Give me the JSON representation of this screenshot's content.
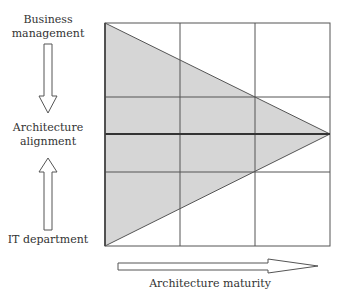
{
  "labels": {
    "top": "Business\nmanagement",
    "middle": "Architecture\nalignment",
    "bottom": "IT department",
    "x_axis": "Architecture maturity"
  },
  "grid": {
    "columns": 3,
    "rows": 4,
    "emphasized_row_line": 2
  },
  "colors": {
    "triangle_fill": "#d6d6d6",
    "line": "#444444",
    "arrow_fill": "#ffffff"
  }
}
